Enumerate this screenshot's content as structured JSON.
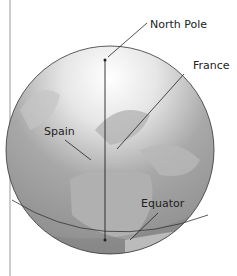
{
  "diagram": {
    "labels": {
      "north_pole": "North Pole",
      "france": "France",
      "spain": "Spain",
      "equator": "Equator"
    },
    "colors": {
      "globe_fill": "#9a9a9a",
      "land": "#b8b8b8",
      "ice": "#f4f4f4",
      "outline": "#333333",
      "leader": "#222222",
      "side_rule": "#999999"
    }
  }
}
